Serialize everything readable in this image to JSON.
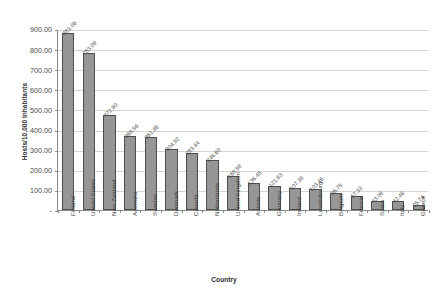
{
  "chart_data": {
    "type": "bar",
    "title": "",
    "xlabel": "Country",
    "ylabel": "Hosts/10,000 Inhabitants",
    "ylim": [
      0,
      900
    ],
    "grid": true,
    "legend": "none",
    "ytick_labels": [
      "900.00",
      "800.00",
      "700.00",
      "600.00",
      "500.00",
      "400.00",
      "300.00",
      "200.00",
      "100.00",
      "-"
    ],
    "ytick_values": [
      900,
      800,
      700,
      600,
      500,
      400,
      300,
      200,
      100,
      0
    ],
    "categories": [
      "Finland",
      "United States",
      "New Zealand",
      "Australia",
      "Sweden",
      "Denmark",
      "Canada",
      "Netherlands",
      "United Kingdom",
      "Austria",
      "Germany",
      "Ireland",
      "Luxembourg",
      "Belgium",
      "France",
      "Spain",
      "Italy",
      "Greece"
    ],
    "values": [
      881.06,
      783.09,
      472.9,
      368.56,
      361.46,
      304.92,
      283.44,
      246.6,
      168.58,
      136.45,
      121.83,
      107.38,
      103.46,
      86.75,
      67.33,
      43.08,
      42.46,
      25.74
    ],
    "value_labels": [
      "881.06",
      "783.09",
      "472.90",
      "368.56",
      "361.46",
      "304.92",
      "283.44",
      "246.60",
      "168.58",
      "136.45",
      "121.83",
      "107.38",
      "103.46",
      "86.75",
      "67.33",
      "43.08",
      "42.46",
      "25.74"
    ],
    "bar_color": "#969696",
    "bar_border_color": "#4d4d4d",
    "grid_color": "#d4d4d4",
    "axis_color": "#8a8a8a"
  },
  "caption": ""
}
